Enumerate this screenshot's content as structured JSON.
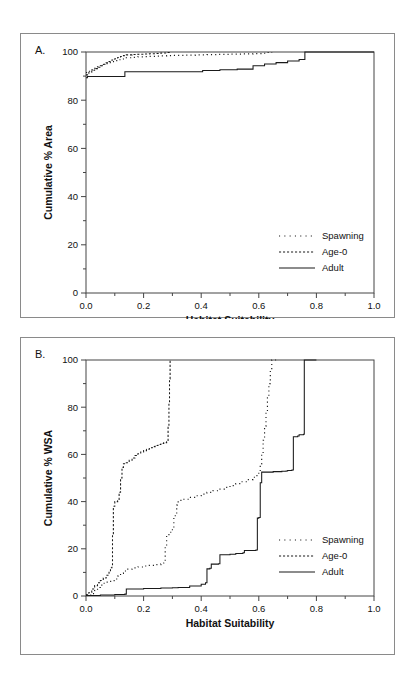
{
  "figure": {
    "panel_a_letter": "A.",
    "panel_b_letter": "B."
  },
  "chart_data": [
    {
      "id": "panel-a",
      "type": "line",
      "title": "A.",
      "xlabel": "Habitat Suitability",
      "ylabel": "Cumulative % Area",
      "xlim": [
        0.0,
        1.0
      ],
      "ylim": [
        0,
        100
      ],
      "xticks": [
        0.0,
        0.2,
        0.4,
        0.6,
        0.8,
        1.0
      ],
      "xtick_labels": [
        "0.0",
        "0.2",
        "0.4",
        "0.6",
        "0.8",
        "1.0"
      ],
      "yticks": [
        0,
        20,
        40,
        60,
        80,
        100
      ],
      "ytick_labels": [
        "0",
        "20",
        "40",
        "60",
        "80",
        "100"
      ],
      "minor_xticks": [
        0.1,
        0.3,
        0.5,
        0.7,
        0.9
      ],
      "minor_yticks": [
        10,
        30,
        50,
        70,
        90
      ],
      "grid": false,
      "legend_position": "lower right",
      "series": [
        {
          "name": "Spawning",
          "style": "dotted",
          "points": [
            [
              0.0,
              91.5
            ],
            [
              0.01,
              92.0
            ],
            [
              0.02,
              92.6
            ],
            [
              0.03,
              93.2
            ],
            [
              0.04,
              93.8
            ],
            [
              0.05,
              94.3
            ],
            [
              0.06,
              94.8
            ],
            [
              0.07,
              95.2
            ],
            [
              0.08,
              95.6
            ],
            [
              0.09,
              96.0
            ],
            [
              0.1,
              96.4
            ],
            [
              0.11,
              96.8
            ],
            [
              0.12,
              97.1
            ],
            [
              0.13,
              97.4
            ],
            [
              0.14,
              97.6
            ],
            [
              0.16,
              97.8
            ],
            [
              0.18,
              98.0
            ],
            [
              0.2,
              98.1
            ],
            [
              0.22,
              98.2
            ],
            [
              0.24,
              98.3
            ],
            [
              0.26,
              98.4
            ],
            [
              0.28,
              98.5
            ],
            [
              0.3,
              98.6
            ],
            [
              0.34,
              98.7
            ],
            [
              0.38,
              98.8
            ],
            [
              0.42,
              98.9
            ],
            [
              0.46,
              99.0
            ],
            [
              0.5,
              99.1
            ],
            [
              0.54,
              99.2
            ],
            [
              0.58,
              99.3
            ],
            [
              0.61,
              99.5
            ],
            [
              0.63,
              99.8
            ],
            [
              0.645,
              100.0
            ]
          ]
        },
        {
          "name": "Age-0",
          "style": "dashed",
          "points": [
            [
              0.0,
              90.5
            ],
            [
              0.01,
              91.6
            ],
            [
              0.02,
              92.4
            ],
            [
              0.03,
              93.1
            ],
            [
              0.04,
              93.7
            ],
            [
              0.05,
              94.3
            ],
            [
              0.06,
              94.9
            ],
            [
              0.07,
              95.5
            ],
            [
              0.08,
              96.1
            ],
            [
              0.09,
              96.7
            ],
            [
              0.1,
              97.2
            ],
            [
              0.11,
              97.7
            ],
            [
              0.12,
              98.1
            ],
            [
              0.13,
              98.5
            ],
            [
              0.14,
              98.8
            ],
            [
              0.16,
              99.0
            ],
            [
              0.18,
              99.1
            ],
            [
              0.2,
              99.2
            ],
            [
              0.22,
              99.3
            ],
            [
              0.24,
              99.4
            ],
            [
              0.26,
              99.6
            ],
            [
              0.28,
              99.8
            ],
            [
              0.295,
              100.0
            ]
          ]
        },
        {
          "name": "Adult",
          "style": "solid",
          "points": [
            [
              0.0,
              89.3
            ],
            [
              0.005,
              89.8
            ],
            [
              0.13,
              89.8
            ],
            [
              0.135,
              91.8
            ],
            [
              0.4,
              91.8
            ],
            [
              0.405,
              92.3
            ],
            [
              0.46,
              92.3
            ],
            [
              0.465,
              92.6
            ],
            [
              0.52,
              92.6
            ],
            [
              0.525,
              92.9
            ],
            [
              0.575,
              92.9
            ],
            [
              0.58,
              94.3
            ],
            [
              0.615,
              94.3
            ],
            [
              0.62,
              95.0
            ],
            [
              0.655,
              95.0
            ],
            [
              0.66,
              95.6
            ],
            [
              0.695,
              95.6
            ],
            [
              0.7,
              96.3
            ],
            [
              0.735,
              96.3
            ],
            [
              0.74,
              96.9
            ],
            [
              0.755,
              96.9
            ],
            [
              0.76,
              100.0
            ],
            [
              1.0,
              100.0
            ]
          ]
        }
      ]
    },
    {
      "id": "panel-b",
      "type": "line",
      "title": "B.",
      "xlabel": "Habitat Suitability",
      "ylabel": "Cumulative % WSA",
      "xlim": [
        0.0,
        1.0
      ],
      "ylim": [
        0,
        100
      ],
      "xticks": [
        0.0,
        0.2,
        0.4,
        0.6,
        0.8,
        1.0
      ],
      "xtick_labels": [
        "0.0",
        "0.2",
        "0.4",
        "0.6",
        "0.8",
        "1.0"
      ],
      "yticks": [
        0,
        20,
        40,
        60,
        80,
        100
      ],
      "ytick_labels": [
        "0",
        "20",
        "40",
        "60",
        "80",
        "100"
      ],
      "minor_xticks": [
        0.1,
        0.3,
        0.5,
        0.7,
        0.9
      ],
      "minor_yticks": [
        10,
        30,
        50,
        70,
        90
      ],
      "grid": false,
      "legend_position": "lower right",
      "series": [
        {
          "name": "Spawning",
          "style": "dotted",
          "points": [
            [
              0.0,
              0.4
            ],
            [
              0.02,
              1.0
            ],
            [
              0.03,
              2.3
            ],
            [
              0.04,
              3.6
            ],
            [
              0.05,
              4.6
            ],
            [
              0.06,
              5.4
            ],
            [
              0.07,
              5.9
            ],
            [
              0.08,
              6.2
            ],
            [
              0.09,
              6.5
            ],
            [
              0.1,
              7.2
            ],
            [
              0.11,
              8.4
            ],
            [
              0.12,
              9.6
            ],
            [
              0.13,
              10.6
            ],
            [
              0.14,
              11.4
            ],
            [
              0.16,
              11.9
            ],
            [
              0.18,
              12.3
            ],
            [
              0.2,
              12.7
            ],
            [
              0.22,
              13.0
            ],
            [
              0.24,
              13.3
            ],
            [
              0.26,
              13.6
            ],
            [
              0.27,
              14.0
            ],
            [
              0.275,
              21.0
            ],
            [
              0.28,
              26.0
            ],
            [
              0.29,
              27.0
            ],
            [
              0.3,
              28.5
            ],
            [
              0.305,
              33.5
            ],
            [
              0.31,
              34.5
            ],
            [
              0.315,
              38.5
            ],
            [
              0.32,
              40.5
            ],
            [
              0.34,
              41.0
            ],
            [
              0.36,
              41.8
            ],
            [
              0.38,
              42.5
            ],
            [
              0.4,
              43.2
            ],
            [
              0.42,
              43.9
            ],
            [
              0.44,
              44.6
            ],
            [
              0.46,
              45.3
            ],
            [
              0.48,
              46.0
            ],
            [
              0.5,
              46.8
            ],
            [
              0.52,
              47.6
            ],
            [
              0.54,
              48.4
            ],
            [
              0.56,
              49.3
            ],
            [
              0.58,
              50.3
            ],
            [
              0.59,
              51.0
            ],
            [
              0.6,
              52.0
            ],
            [
              0.605,
              56.0
            ],
            [
              0.61,
              60.0
            ],
            [
              0.615,
              66.0
            ],
            [
              0.62,
              72.0
            ],
            [
              0.625,
              78.0
            ],
            [
              0.63,
              84.0
            ],
            [
              0.635,
              90.0
            ],
            [
              0.64,
              96.0
            ],
            [
              0.645,
              100.0
            ],
            [
              0.66,
              100.0
            ]
          ]
        },
        {
          "name": "Age-0",
          "style": "dashed",
          "points": [
            [
              0.0,
              0.5
            ],
            [
              0.01,
              1.5
            ],
            [
              0.02,
              3.0
            ],
            [
              0.03,
              4.4
            ],
            [
              0.04,
              5.6
            ],
            [
              0.05,
              6.6
            ],
            [
              0.06,
              7.6
            ],
            [
              0.07,
              8.8
            ],
            [
              0.08,
              10.3
            ],
            [
              0.085,
              12.0
            ],
            [
              0.09,
              13.0
            ],
            [
              0.092,
              26.0
            ],
            [
              0.095,
              38.0
            ],
            [
              0.1,
              40.0
            ],
            [
              0.11,
              40.4
            ],
            [
              0.115,
              44.0
            ],
            [
              0.12,
              50.0
            ],
            [
              0.125,
              54.5
            ],
            [
              0.13,
              56.0
            ],
            [
              0.14,
              56.5
            ],
            [
              0.15,
              57.5
            ],
            [
              0.16,
              58.5
            ],
            [
              0.17,
              59.5
            ],
            [
              0.18,
              60.3
            ],
            [
              0.19,
              61.0
            ],
            [
              0.2,
              61.6
            ],
            [
              0.21,
              62.2
            ],
            [
              0.22,
              62.8
            ],
            [
              0.23,
              63.3
            ],
            [
              0.24,
              63.8
            ],
            [
              0.25,
              64.2
            ],
            [
              0.26,
              64.6
            ],
            [
              0.27,
              65.0
            ],
            [
              0.28,
              65.4
            ],
            [
              0.285,
              72.0
            ],
            [
              0.288,
              82.0
            ],
            [
              0.29,
              92.0
            ],
            [
              0.292,
              100.0
            ]
          ]
        },
        {
          "name": "Adult",
          "style": "solid",
          "points": [
            [
              0.0,
              0.2
            ],
            [
              0.05,
              0.4
            ],
            [
              0.1,
              0.6
            ],
            [
              0.135,
              0.8
            ],
            [
              0.14,
              3.0
            ],
            [
              0.2,
              3.2
            ],
            [
              0.26,
              3.4
            ],
            [
              0.3,
              3.5
            ],
            [
              0.32,
              3.6
            ],
            [
              0.36,
              4.2
            ],
            [
              0.4,
              5.0
            ],
            [
              0.415,
              5.6
            ],
            [
              0.42,
              11.5
            ],
            [
              0.43,
              11.8
            ],
            [
              0.435,
              13.5
            ],
            [
              0.46,
              13.7
            ],
            [
              0.465,
              17.5
            ],
            [
              0.5,
              17.7
            ],
            [
              0.52,
              18.0
            ],
            [
              0.545,
              18.3
            ],
            [
              0.55,
              19.3
            ],
            [
              0.59,
              19.5
            ],
            [
              0.595,
              33.0
            ],
            [
              0.6,
              33.3
            ],
            [
              0.605,
              48.0
            ],
            [
              0.61,
              52.5
            ],
            [
              0.65,
              52.7
            ],
            [
              0.68,
              52.9
            ],
            [
              0.695,
              53.0
            ],
            [
              0.7,
              53.2
            ],
            [
              0.715,
              53.4
            ],
            [
              0.72,
              67.5
            ],
            [
              0.735,
              67.8
            ],
            [
              0.74,
              68.3
            ],
            [
              0.755,
              68.5
            ],
            [
              0.758,
              100.0
            ],
            [
              0.8,
              100.0
            ]
          ]
        }
      ]
    }
  ],
  "legend": {
    "entries": [
      {
        "label": "Spawning",
        "style": "dotted"
      },
      {
        "label": "Age-0",
        "style": "dashed"
      },
      {
        "label": "Adult",
        "style": "solid"
      }
    ]
  }
}
